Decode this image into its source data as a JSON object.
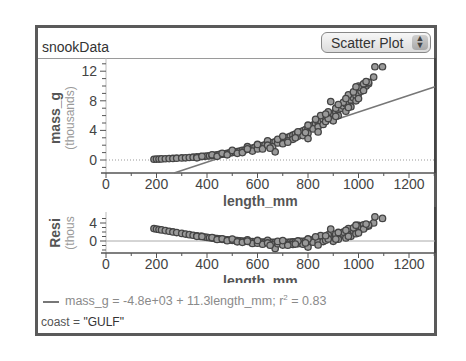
{
  "header": {
    "title": "snookData",
    "plot_type": "Scatter Plot"
  },
  "legend": {
    "equation_lhs": "mass_g = -4.8e+03 + 11.3length_mm; r",
    "r2_sup": "2",
    "equation_rhs": " = 0.83",
    "line_color": "#777777"
  },
  "filter": {
    "label": "coast",
    "eq": " = ",
    "value": "\"GULF\""
  },
  "chart_data": [
    {
      "type": "scatter",
      "title": "",
      "xlabel": "length_mm",
      "ylabel": "mass_g",
      "ylabel_sub": "(thousands)",
      "xticks": [
        0,
        200,
        400,
        600,
        800,
        1000,
        1200
      ],
      "yticks": [
        0,
        4,
        8,
        12
      ],
      "xlim": [
        0,
        1300
      ],
      "ylim": [
        -1.5,
        13.5
      ],
      "regression": {
        "intercept": -4800,
        "slope": 11.3,
        "r2": 0.83
      },
      "points_desc": "length_mm vs mass_g (g); ~300 points, GULF coast snook",
      "points": [
        [
          190,
          100
        ],
        [
          200,
          120
        ],
        [
          210,
          130
        ],
        [
          220,
          150
        ],
        [
          235,
          170
        ],
        [
          250,
          190
        ],
        [
          265,
          210
        ],
        [
          280,
          240
        ],
        [
          300,
          280
        ],
        [
          315,
          300
        ],
        [
          330,
          340
        ],
        [
          345,
          380
        ],
        [
          360,
          420
        ],
        [
          375,
          460
        ],
        [
          390,
          500
        ],
        [
          400,
          540
        ],
        [
          410,
          560
        ],
        [
          420,
          600
        ],
        [
          430,
          640
        ],
        [
          440,
          700
        ],
        [
          450,
          760
        ],
        [
          460,
          780
        ],
        [
          470,
          840
        ],
        [
          480,
          900
        ],
        [
          490,
          960
        ],
        [
          500,
          1000
        ],
        [
          510,
          1080
        ],
        [
          520,
          1150
        ],
        [
          530,
          1200
        ],
        [
          540,
          1300
        ],
        [
          550,
          1350
        ],
        [
          560,
          1450
        ],
        [
          570,
          1500
        ],
        [
          580,
          1600
        ],
        [
          590,
          1700
        ],
        [
          600,
          1800
        ],
        [
          610,
          1850
        ],
        [
          620,
          1950
        ],
        [
          630,
          2050
        ],
        [
          640,
          2150
        ],
        [
          650,
          2250
        ],
        [
          660,
          2350
        ],
        [
          670,
          2450
        ],
        [
          680,
          2550
        ],
        [
          690,
          2650
        ],
        [
          700,
          2800
        ],
        [
          710,
          2950
        ],
        [
          720,
          3050
        ],
        [
          730,
          3200
        ],
        [
          740,
          3350
        ],
        [
          750,
          3500
        ],
        [
          760,
          3650
        ],
        [
          770,
          3800
        ],
        [
          780,
          3950
        ],
        [
          790,
          4100
        ],
        [
          800,
          4300
        ],
        [
          810,
          4500
        ],
        [
          820,
          4700
        ],
        [
          830,
          4900
        ],
        [
          840,
          5100
        ],
        [
          850,
          5300
        ],
        [
          860,
          5500
        ],
        [
          870,
          5700
        ],
        [
          880,
          5900
        ],
        [
          890,
          6100
        ],
        [
          900,
          6300
        ],
        [
          910,
          6500
        ],
        [
          920,
          6800
        ],
        [
          930,
          7000
        ],
        [
          940,
          7300
        ],
        [
          950,
          7600
        ],
        [
          960,
          7800
        ],
        [
          970,
          8100
        ],
        [
          980,
          8400
        ],
        [
          990,
          8700
        ],
        [
          1000,
          9000
        ],
        [
          1010,
          9300
        ],
        [
          1020,
          9700
        ],
        [
          1030,
          10000
        ],
        [
          1040,
          10300
        ],
        [
          1060,
          11200
        ],
        [
          1065,
          12600
        ],
        [
          1095,
          12600
        ],
        [
          360,
          300
        ],
        [
          380,
          500
        ],
        [
          420,
          700
        ],
        [
          440,
          500
        ],
        [
          460,
          900
        ],
        [
          480,
          700
        ],
        [
          500,
          1300
        ],
        [
          520,
          900
        ],
        [
          540,
          1000
        ],
        [
          560,
          1800
        ],
        [
          580,
          1200
        ],
        [
          600,
          1500
        ],
        [
          620,
          1500
        ],
        [
          640,
          2600
        ],
        [
          660,
          1800
        ],
        [
          670,
          1100
        ],
        [
          680,
          2300
        ],
        [
          700,
          2200
        ],
        [
          720,
          2600
        ],
        [
          740,
          2800
        ],
        [
          760,
          3200
        ],
        [
          780,
          3300
        ],
        [
          800,
          3600
        ],
        [
          800,
          2900
        ],
        [
          820,
          4200
        ],
        [
          840,
          4500
        ],
        [
          850,
          6000
        ],
        [
          860,
          4800
        ],
        [
          870,
          5200
        ],
        [
          880,
          6500
        ],
        [
          890,
          7900
        ],
        [
          900,
          5300
        ],
        [
          910,
          7000
        ],
        [
          920,
          6000
        ],
        [
          940,
          7800
        ],
        [
          950,
          6600
        ],
        [
          960,
          8800
        ],
        [
          970,
          7200
        ],
        [
          980,
          9200
        ],
        [
          990,
          8000
        ],
        [
          1000,
          10000
        ],
        [
          1010,
          9800
        ],
        [
          1020,
          10300
        ],
        [
          1020,
          9400
        ],
        [
          1040,
          10500
        ],
        [
          560,
          1500
        ],
        [
          600,
          2100
        ],
        [
          640,
          2000
        ],
        [
          680,
          2800
        ],
        [
          720,
          2400
        ],
        [
          760,
          3800
        ],
        [
          800,
          4700
        ],
        [
          840,
          3800
        ],
        [
          880,
          5600
        ],
        [
          920,
          7500
        ],
        [
          960,
          7100
        ],
        [
          990,
          9900
        ],
        [
          1000,
          8300
        ],
        [
          1030,
          10600
        ],
        [
          650,
          1600
        ],
        [
          700,
          3200
        ],
        [
          750,
          3000
        ],
        [
          790,
          3700
        ],
        [
          830,
          5500
        ],
        [
          870,
          6200
        ],
        [
          910,
          5900
        ],
        [
          950,
          8300
        ]
      ]
    }
  ],
  "residual_plot": {
    "ylabel": "Resi",
    "ylabel_sub": "(thous",
    "xlabel": "length_mm",
    "xticks": [
      0,
      200,
      400,
      600,
      800,
      1000,
      1200
    ],
    "yticks": [
      0,
      4
    ]
  }
}
